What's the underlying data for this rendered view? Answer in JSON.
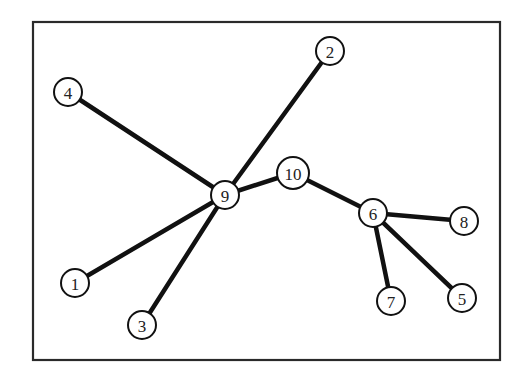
{
  "diagram": {
    "type": "tree-graph",
    "frame": {
      "x": 33,
      "y": 22,
      "width": 467,
      "height": 338
    },
    "node_radius": 14,
    "colors": {
      "edge": "#111111",
      "node_fill": "#ffffff",
      "node_stroke": "#111111",
      "frame": "#2a2a2a"
    },
    "nodes": [
      {
        "id": "1",
        "label": "1",
        "x": 75,
        "y": 283
      },
      {
        "id": "2",
        "label": "2",
        "x": 330,
        "y": 51
      },
      {
        "id": "3",
        "label": "3",
        "x": 142,
        "y": 325
      },
      {
        "id": "4",
        "label": "4",
        "x": 68,
        "y": 92
      },
      {
        "id": "5",
        "label": "5",
        "x": 462,
        "y": 298
      },
      {
        "id": "6",
        "label": "6",
        "x": 373,
        "y": 213
      },
      {
        "id": "7",
        "label": "7",
        "x": 391,
        "y": 301
      },
      {
        "id": "8",
        "label": "8",
        "x": 464,
        "y": 221
      },
      {
        "id": "9",
        "label": "9",
        "x": 225,
        "y": 195
      },
      {
        "id": "10",
        "label": "10",
        "x": 293,
        "y": 173
      }
    ],
    "edges": [
      {
        "from": "9",
        "to": "4"
      },
      {
        "from": "9",
        "to": "2"
      },
      {
        "from": "9",
        "to": "1"
      },
      {
        "from": "9",
        "to": "3"
      },
      {
        "from": "9",
        "to": "10"
      },
      {
        "from": "10",
        "to": "6"
      },
      {
        "from": "6",
        "to": "8"
      },
      {
        "from": "6",
        "to": "7"
      },
      {
        "from": "6",
        "to": "5"
      }
    ]
  }
}
